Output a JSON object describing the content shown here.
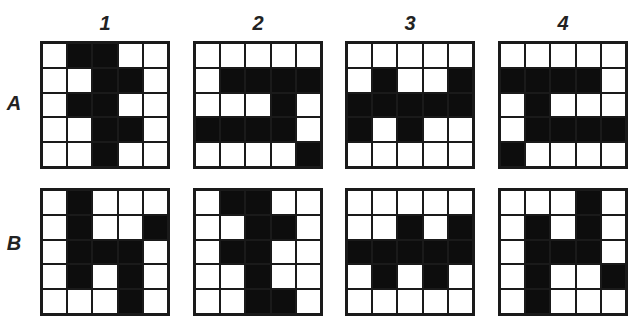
{
  "columns": [
    "1",
    "2",
    "3",
    "4"
  ],
  "rows": [
    "A",
    "B"
  ],
  "colors": {
    "filled": "#0d0d0d",
    "empty": "#ffffff",
    "border": "#1a1a1a"
  },
  "grids": {
    "A1": [
      [
        0,
        1,
        1,
        0,
        0
      ],
      [
        0,
        0,
        1,
        1,
        0
      ],
      [
        0,
        1,
        1,
        0,
        0
      ],
      [
        0,
        0,
        1,
        1,
        0
      ],
      [
        0,
        0,
        1,
        0,
        0
      ]
    ],
    "A2": [
      [
        0,
        0,
        0,
        0,
        0
      ],
      [
        0,
        1,
        1,
        1,
        1
      ],
      [
        0,
        0,
        0,
        1,
        0
      ],
      [
        1,
        1,
        1,
        1,
        0
      ],
      [
        0,
        0,
        0,
        0,
        1
      ]
    ],
    "A3": [
      [
        0,
        0,
        0,
        0,
        0
      ],
      [
        0,
        1,
        0,
        0,
        1
      ],
      [
        1,
        1,
        1,
        1,
        1
      ],
      [
        1,
        0,
        1,
        0,
        0
      ],
      [
        0,
        0,
        0,
        0,
        0
      ]
    ],
    "A4": [
      [
        0,
        0,
        0,
        0,
        0
      ],
      [
        1,
        1,
        1,
        1,
        0
      ],
      [
        0,
        1,
        0,
        0,
        0
      ],
      [
        0,
        1,
        1,
        1,
        1
      ],
      [
        1,
        0,
        0,
        0,
        0
      ]
    ],
    "B1": [
      [
        0,
        1,
        0,
        0,
        0
      ],
      [
        0,
        1,
        0,
        0,
        1
      ],
      [
        0,
        1,
        1,
        1,
        0
      ],
      [
        0,
        1,
        0,
        1,
        0
      ],
      [
        0,
        0,
        0,
        1,
        0
      ]
    ],
    "B2": [
      [
        0,
        1,
        1,
        0,
        0
      ],
      [
        0,
        0,
        1,
        1,
        0
      ],
      [
        0,
        1,
        1,
        0,
        0
      ],
      [
        0,
        0,
        1,
        0,
        0
      ],
      [
        0,
        0,
        1,
        1,
        0
      ]
    ],
    "B3": [
      [
        0,
        0,
        0,
        0,
        0
      ],
      [
        0,
        0,
        1,
        0,
        1
      ],
      [
        1,
        1,
        1,
        1,
        1
      ],
      [
        0,
        1,
        0,
        1,
        0
      ],
      [
        0,
        0,
        0,
        0,
        0
      ]
    ],
    "B4": [
      [
        0,
        0,
        0,
        1,
        0
      ],
      [
        0,
        1,
        0,
        1,
        0
      ],
      [
        0,
        1,
        1,
        1,
        0
      ],
      [
        0,
        1,
        0,
        0,
        1
      ],
      [
        0,
        1,
        0,
        0,
        0
      ]
    ]
  }
}
